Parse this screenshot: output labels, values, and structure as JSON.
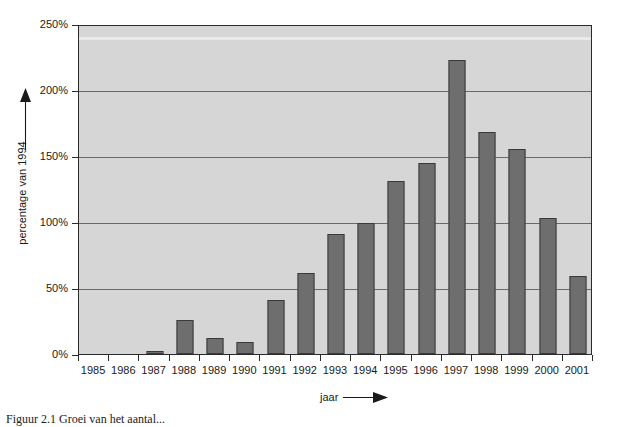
{
  "chart_data": {
    "type": "bar",
    "title": "",
    "subtitle": "",
    "xlabel": "jaar",
    "ylabel": "percentage van 1994",
    "categories": [
      "1985",
      "1986",
      "1987",
      "1988",
      "1989",
      "1990",
      "1991",
      "1992",
      "1993",
      "1994",
      "1995",
      "1996",
      "1997",
      "1998",
      "1999",
      "2000",
      "2001"
    ],
    "values": [
      0,
      0,
      2,
      26,
      12,
      9,
      41,
      61,
      91,
      99,
      131,
      145,
      223,
      168,
      155,
      103,
      59
    ],
    "ylim": [
      0,
      250
    ],
    "ytick_values": [
      0,
      50,
      100,
      150,
      200,
      250
    ],
    "ytick_labels": [
      "0%",
      "50%",
      "100%",
      "150%",
      "200%",
      "250%"
    ],
    "y_unit": "%",
    "grid": true,
    "grid_axis": "y",
    "legend": false,
    "legend_position": "none",
    "bar_color": "#6e6e6e",
    "bar_edge_color": "#3a3a3a",
    "plot_background": "#d6d6d6",
    "page_background": "#ffffff",
    "gridline_color": "#6a6a6a",
    "axis_color": "#2b2b2b",
    "text_color": "#1a1a1a"
  },
  "axes": {
    "y": {
      "title": "percentage van 1994",
      "arrow": "up-arrow",
      "ticks": [
        {
          "label": "250%",
          "value": 250
        },
        {
          "label": "200%",
          "value": 200
        },
        {
          "label": "150%",
          "value": 150
        },
        {
          "label": "100%",
          "value": 100
        },
        {
          "label": "50%",
          "value": 50
        },
        {
          "label": "0%",
          "value": 0
        }
      ]
    },
    "x": {
      "title": "jaar",
      "arrow": "right-arrow",
      "ticks": [
        {
          "label": "1985"
        },
        {
          "label": "1986"
        },
        {
          "label": "1987"
        },
        {
          "label": "1988"
        },
        {
          "label": "1989"
        },
        {
          "label": "1990"
        },
        {
          "label": "1991"
        },
        {
          "label": "1992"
        },
        {
          "label": "1993"
        },
        {
          "label": "1994"
        },
        {
          "label": "1995"
        },
        {
          "label": "1996"
        },
        {
          "label": "1997"
        },
        {
          "label": "1998"
        },
        {
          "label": "1999"
        },
        {
          "label": "2000"
        },
        {
          "label": "2001"
        }
      ]
    }
  },
  "caption": {
    "text": "Figuur 2.1 Groei van het aantal..."
  }
}
